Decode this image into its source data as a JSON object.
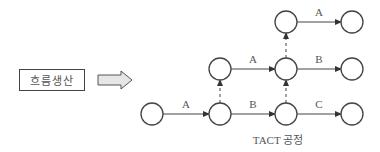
{
  "left_box": {
    "label": "흐름생산"
  },
  "caption": "TACT 공정",
  "nodes": [
    {
      "id": "n0",
      "cx": 152,
      "cy": 114
    },
    {
      "id": "n1",
      "cx": 220,
      "cy": 114
    },
    {
      "id": "n2",
      "cx": 286,
      "cy": 114
    },
    {
      "id": "n3",
      "cx": 352,
      "cy": 114
    },
    {
      "id": "n4",
      "cx": 220,
      "cy": 69
    },
    {
      "id": "n5",
      "cx": 286,
      "cy": 69
    },
    {
      "id": "n6",
      "cx": 352,
      "cy": 69
    },
    {
      "id": "n7",
      "cx": 286,
      "cy": 22
    },
    {
      "id": "n8",
      "cx": 352,
      "cy": 22
    }
  ],
  "edges": [
    {
      "from": "n0",
      "to": "n1",
      "label": "A",
      "type": "solid"
    },
    {
      "from": "n1",
      "to": "n2",
      "label": "B",
      "type": "solid"
    },
    {
      "from": "n2",
      "to": "n3",
      "label": "C",
      "type": "solid"
    },
    {
      "from": "n4",
      "to": "n5",
      "label": "A",
      "type": "solid"
    },
    {
      "from": "n5",
      "to": "n6",
      "label": "B",
      "type": "solid"
    },
    {
      "from": "n7",
      "to": "n8",
      "label": "A",
      "type": "solid"
    },
    {
      "from": "n1",
      "to": "n4",
      "label": "",
      "type": "dashed"
    },
    {
      "from": "n2",
      "to": "n5",
      "label": "",
      "type": "dashed"
    },
    {
      "from": "n5",
      "to": "n7",
      "label": "",
      "type": "dashed"
    }
  ]
}
